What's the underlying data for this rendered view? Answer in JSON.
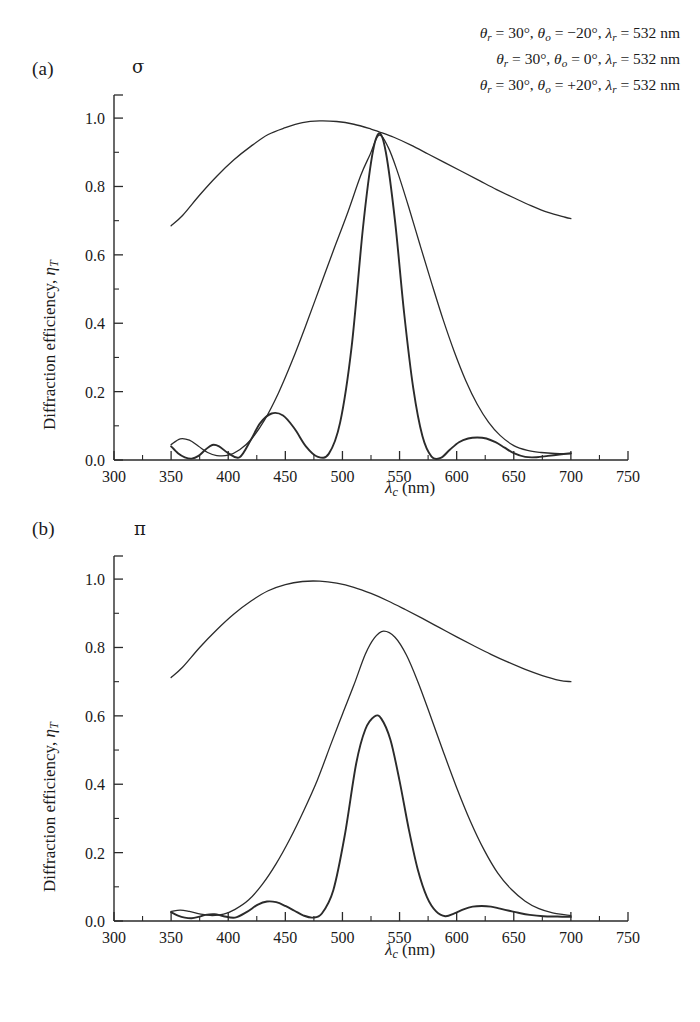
{
  "figure": {
    "panels": [
      {
        "id": "a",
        "label": "(a)",
        "polarization_symbol": "σ",
        "polarization_name": "sigma"
      },
      {
        "id": "b",
        "label": "(b)",
        "polarization_symbol": "π",
        "polarization_name": "pi"
      }
    ],
    "legend": {
      "lines": [
        "θr = 30°, θo = −20°, λr = 532 nm",
        "θr = 30°, θo = 0°, λr = 532 nm",
        "θr = 30°, θo = +20°, λr = 532 nm"
      ]
    },
    "axis_labels": {
      "x": "λc (nm)",
      "y": "Diffraction efficiency, ηT"
    }
  },
  "chart_data": [
    {
      "type": "line",
      "title": "(a) σ polarization",
      "xlabel": "λc (nm)",
      "ylabel": "Diffraction efficiency, ηT",
      "xlim": [
        300,
        750
      ],
      "ylim": [
        0.0,
        1.05
      ],
      "xticks": [
        300,
        350,
        400,
        450,
        500,
        550,
        600,
        650,
        700,
        750
      ],
      "xticklabels": [
        "300",
        "350",
        "400",
        "450",
        "500",
        "550",
        "600",
        "650",
        "700",
        "750"
      ],
      "xminor_step": 25,
      "yticks": [
        0.0,
        0.2,
        0.4,
        0.6,
        0.8,
        1.0
      ],
      "yticklabels": [
        "0.0",
        "0.2",
        "0.4",
        "0.6",
        "0.8",
        "1.0"
      ],
      "yminor_step": 0.1,
      "grid": false,
      "legend_position": "top-right",
      "series": [
        {
          "name": "θo = −20°",
          "color": "#2b2b2b",
          "width": 1.3,
          "x": [
            350,
            360,
            375,
            390,
            405,
            420,
            435,
            450,
            465,
            480,
            495,
            510,
            525,
            532,
            545,
            560,
            575,
            590,
            605,
            620,
            635,
            650,
            665,
            680,
            695,
            700
          ],
          "y": [
            0.685,
            0.715,
            0.775,
            0.83,
            0.878,
            0.918,
            0.952,
            0.972,
            0.987,
            0.992,
            0.99,
            0.982,
            0.968,
            0.96,
            0.944,
            0.921,
            0.895,
            0.869,
            0.843,
            0.817,
            0.791,
            0.767,
            0.744,
            0.724,
            0.71,
            0.706
          ]
        },
        {
          "name": "θo = 0°",
          "color": "#2b2b2b",
          "width": 1.3,
          "x": [
            350,
            358,
            366,
            374,
            382,
            390,
            400,
            410,
            420,
            432,
            444,
            456,
            468,
            480,
            492,
            504,
            516,
            524,
            532,
            540,
            548,
            558,
            568,
            578,
            588,
            598,
            608,
            618,
            628,
            638,
            650,
            662,
            674,
            686,
            700
          ],
          "y": [
            0.045,
            0.062,
            0.058,
            0.04,
            0.022,
            0.013,
            0.014,
            0.03,
            0.06,
            0.118,
            0.196,
            0.29,
            0.394,
            0.503,
            0.612,
            0.718,
            0.832,
            0.892,
            0.95,
            0.915,
            0.845,
            0.74,
            0.628,
            0.518,
            0.412,
            0.316,
            0.232,
            0.163,
            0.11,
            0.072,
            0.042,
            0.028,
            0.022,
            0.019,
            0.018
          ]
        },
        {
          "name": "θo = +20°",
          "color": "#2b2b2b",
          "width": 1.9,
          "x": [
            350,
            356,
            362,
            368,
            374,
            380,
            386,
            392,
            400,
            410,
            420,
            428,
            438,
            448,
            458,
            468,
            478,
            488,
            498,
            508,
            518,
            526,
            532,
            538,
            546,
            554,
            562,
            570,
            578,
            586,
            594,
            602,
            610,
            618,
            626,
            634,
            642,
            650,
            660,
            670,
            680,
            690,
            700
          ],
          "y": [
            0.04,
            0.02,
            0.008,
            0.004,
            0.012,
            0.03,
            0.044,
            0.04,
            0.02,
            0.008,
            0.06,
            0.108,
            0.136,
            0.13,
            0.092,
            0.04,
            0.01,
            0.018,
            0.11,
            0.33,
            0.68,
            0.89,
            0.955,
            0.9,
            0.7,
            0.43,
            0.21,
            0.07,
            0.01,
            0.006,
            0.03,
            0.052,
            0.063,
            0.066,
            0.063,
            0.052,
            0.036,
            0.02,
            0.009,
            0.008,
            0.012,
            0.016,
            0.02
          ]
        }
      ]
    },
    {
      "type": "line",
      "title": "(b) π polarization",
      "xlabel": "λc (nm)",
      "ylabel": "Diffraction efficiency, ηT",
      "xlim": [
        300,
        750
      ],
      "ylim": [
        0.0,
        1.05
      ],
      "xticks": [
        300,
        350,
        400,
        450,
        500,
        550,
        600,
        650,
        700,
        750
      ],
      "xticklabels": [
        "300",
        "350",
        "400",
        "450",
        "500",
        "550",
        "600",
        "650",
        "700",
        "750"
      ],
      "xminor_step": 25,
      "yticks": [
        0.0,
        0.2,
        0.4,
        0.6,
        0.8,
        1.0
      ],
      "yticklabels": [
        "0.0",
        "0.2",
        "0.4",
        "0.6",
        "0.8",
        "1.0"
      ],
      "yminor_step": 0.1,
      "grid": false,
      "legend_position": "none",
      "series": [
        {
          "name": "θo = −20°",
          "color": "#2b2b2b",
          "width": 1.3,
          "x": [
            350,
            360,
            375,
            390,
            405,
            420,
            435,
            450,
            465,
            480,
            495,
            510,
            525,
            540,
            555,
            570,
            585,
            600,
            615,
            630,
            645,
            660,
            675,
            690,
            700
          ],
          "y": [
            0.712,
            0.742,
            0.8,
            0.852,
            0.898,
            0.936,
            0.966,
            0.984,
            0.993,
            0.994,
            0.988,
            0.976,
            0.958,
            0.936,
            0.911,
            0.885,
            0.858,
            0.831,
            0.805,
            0.78,
            0.757,
            0.736,
            0.718,
            0.704,
            0.7
          ]
        },
        {
          "name": "θo = 0°",
          "color": "#2b2b2b",
          "width": 1.3,
          "x": [
            350,
            358,
            366,
            376,
            386,
            396,
            406,
            418,
            430,
            442,
            454,
            466,
            478,
            490,
            500,
            510,
            520,
            528,
            536,
            546,
            556,
            566,
            576,
            588,
            600,
            612,
            624,
            636,
            648,
            660,
            672,
            684,
            700
          ],
          "y": [
            0.028,
            0.032,
            0.028,
            0.02,
            0.016,
            0.02,
            0.034,
            0.062,
            0.108,
            0.168,
            0.24,
            0.322,
            0.412,
            0.518,
            0.605,
            0.69,
            0.78,
            0.828,
            0.848,
            0.83,
            0.778,
            0.7,
            0.61,
            0.498,
            0.39,
            0.292,
            0.208,
            0.14,
            0.092,
            0.058,
            0.036,
            0.024,
            0.016
          ]
        },
        {
          "name": "θo = +20°",
          "color": "#2b2b2b",
          "width": 1.9,
          "x": [
            350,
            356,
            362,
            368,
            374,
            380,
            388,
            396,
            406,
            416,
            426,
            434,
            442,
            450,
            458,
            466,
            474,
            482,
            492,
            502,
            512,
            520,
            528,
            534,
            542,
            550,
            558,
            566,
            574,
            582,
            590,
            598,
            606,
            614,
            622,
            630,
            638,
            646,
            654,
            664,
            676,
            688,
            700
          ],
          "y": [
            0.026,
            0.016,
            0.01,
            0.008,
            0.012,
            0.018,
            0.02,
            0.014,
            0.01,
            0.026,
            0.048,
            0.057,
            0.055,
            0.044,
            0.03,
            0.016,
            0.01,
            0.022,
            0.09,
            0.25,
            0.46,
            0.56,
            0.598,
            0.592,
            0.53,
            0.41,
            0.27,
            0.15,
            0.07,
            0.028,
            0.014,
            0.022,
            0.034,
            0.042,
            0.044,
            0.042,
            0.036,
            0.03,
            0.024,
            0.018,
            0.014,
            0.013,
            0.012
          ]
        }
      ]
    }
  ]
}
